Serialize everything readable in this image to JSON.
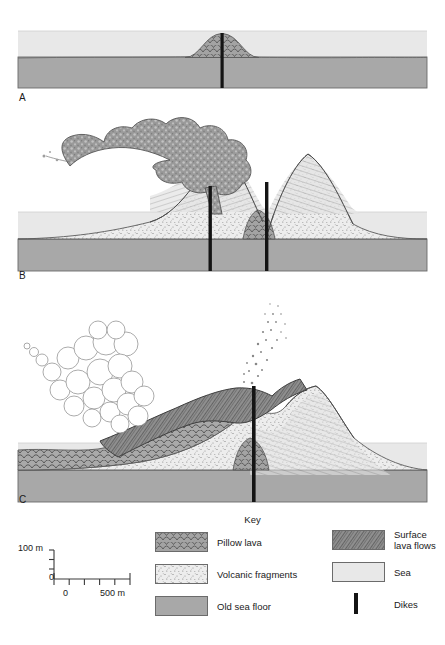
{
  "figure": {
    "type": "geological-cross-section",
    "panels": [
      {
        "id": "A",
        "label": "A",
        "caption": "Submarine pillow lava mound on the old sea floor, fed by a dike; entirely below sea level",
        "features": [
          "pillow lava",
          "old sea floor",
          "sea",
          "dike"
        ]
      },
      {
        "id": "B",
        "label": "B",
        "caption": "Two cones of volcanic fragments build above sea level; dark ash plume erupts from the left vent",
        "features": [
          "volcanic fragments",
          "pillow lava",
          "old sea floor",
          "sea",
          "dikes",
          "ash plume"
        ]
      },
      {
        "id": "C",
        "label": "C",
        "caption": "Mature volcanic island capped by surface lava flows, with a white steam plume and an ash jet at the summit vent",
        "features": [
          "surface lava flows",
          "volcanic fragments",
          "pillow lava",
          "old sea floor",
          "sea",
          "dike",
          "steam plume",
          "ash jet"
        ]
      }
    ]
  },
  "key": {
    "title": "Key",
    "left_items": [
      {
        "label": "Pillow lava",
        "pattern": "pillow-lava-pattern",
        "color": "#a3a3a3"
      },
      {
        "label": "Volcanic fragments",
        "pattern": "volcanic-fragments-pattern",
        "color": "#ededed"
      },
      {
        "label": "Old sea floor",
        "pattern": "solid-fill",
        "color": "#a8a8a8"
      }
    ],
    "right_items": [
      {
        "label": "Surface\nlava flows",
        "pattern": "surface-lava-pattern",
        "color": "#8f8f8f"
      },
      {
        "label": "Sea",
        "pattern": "solid-fill",
        "color": "#e8e8e8"
      },
      {
        "label": "Dikes",
        "pattern": "dike-bar",
        "color": "#141414"
      }
    ]
  },
  "scale": {
    "vertical_top_label": "100 m",
    "vertical_zero_label": "0",
    "horizontal_zero_label": "0",
    "horizontal_max_label": "500 m",
    "vertical_ticks": 2,
    "horizontal_ticks": 5
  },
  "colors": {
    "sea": "#e8e8e8",
    "old_sea_floor": "#a8a8a8",
    "pillow_lava": "#a3a3a3",
    "volcanic_fragments": "#ededed",
    "surface_lava": "#8f8f8f",
    "dike": "#141414",
    "ash_plume": "#8a8a8a",
    "steam_plume": "#ffffff",
    "outline": "#5a5a5a"
  }
}
